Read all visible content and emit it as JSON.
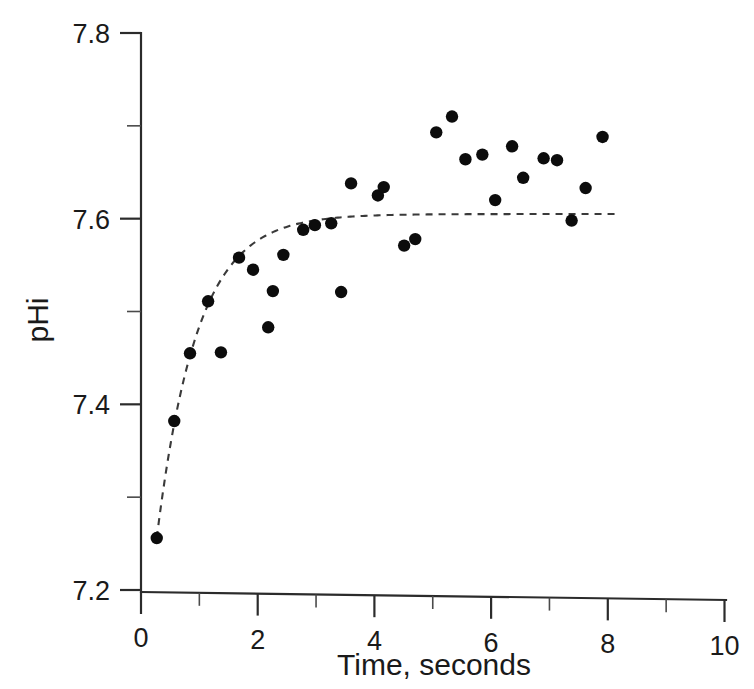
{
  "chart_data": {
    "type": "scatter",
    "title": "",
    "xlabel": "Time, seconds",
    "ylabel": "pHi",
    "xlim": [
      0,
      10
    ],
    "ylim": [
      7.2,
      7.8
    ],
    "xticks": [
      0,
      2,
      4,
      6,
      8,
      10
    ],
    "xtick_labels": [
      "0",
      "2",
      "4",
      "6",
      "8",
      "10"
    ],
    "xminor_ticks": [
      1,
      3,
      5,
      7,
      9
    ],
    "yticks": [
      7.2,
      7.4,
      7.6,
      7.8
    ],
    "ytick_labels": [
      "7.2",
      "7.4",
      "7.6",
      "7.8"
    ],
    "yminor_ticks": [
      7.3,
      7.5,
      7.7
    ],
    "grid": false,
    "legend": null,
    "marker": "filled-circle",
    "marker_color": "#0c0c0c",
    "points": [
      {
        "x": 0.27,
        "y": 7.256
      },
      {
        "x": 0.57,
        "y": 7.382
      },
      {
        "x": 0.84,
        "y": 7.455
      },
      {
        "x": 1.15,
        "y": 7.511
      },
      {
        "x": 1.37,
        "y": 7.456
      },
      {
        "x": 1.68,
        "y": 7.558
      },
      {
        "x": 1.92,
        "y": 7.545
      },
      {
        "x": 2.18,
        "y": 7.483
      },
      {
        "x": 2.26,
        "y": 7.522
      },
      {
        "x": 2.44,
        "y": 7.561
      },
      {
        "x": 2.78,
        "y": 7.588
      },
      {
        "x": 2.98,
        "y": 7.593
      },
      {
        "x": 3.26,
        "y": 7.595
      },
      {
        "x": 3.43,
        "y": 7.521
      },
      {
        "x": 3.6,
        "y": 7.638
      },
      {
        "x": 4.06,
        "y": 7.625
      },
      {
        "x": 4.16,
        "y": 7.634
      },
      {
        "x": 4.51,
        "y": 7.571
      },
      {
        "x": 4.7,
        "y": 7.578
      },
      {
        "x": 5.06,
        "y": 7.693
      },
      {
        "x": 5.33,
        "y": 7.71
      },
      {
        "x": 5.56,
        "y": 7.664
      },
      {
        "x": 5.85,
        "y": 7.669
      },
      {
        "x": 6.07,
        "y": 7.62
      },
      {
        "x": 6.36,
        "y": 7.678
      },
      {
        "x": 6.55,
        "y": 7.644
      },
      {
        "x": 6.9,
        "y": 7.665
      },
      {
        "x": 7.13,
        "y": 7.663
      },
      {
        "x": 7.38,
        "y": 7.598
      },
      {
        "x": 7.62,
        "y": 7.633
      },
      {
        "x": 7.91,
        "y": 7.688
      }
    ],
    "fit_curve": {
      "style": "dashed",
      "color": "#3a3a3a",
      "model": "exponential rise to plateau",
      "plateau": 7.605,
      "y0": 7.256,
      "rate_per_second": 1.45,
      "x_start": 0.27,
      "x_end": 8.12
    }
  },
  "axes": {
    "y_axis_label": "pHi",
    "x_axis_label": "Time, seconds"
  }
}
